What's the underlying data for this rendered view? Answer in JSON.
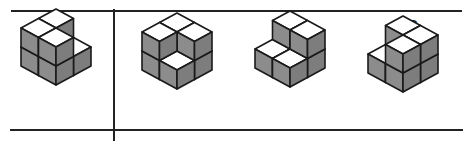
{
  "colors": {
    "top_face": "#ffffff",
    "side_face": "#8c8c8c",
    "side_face_dark": "#7d7d7d",
    "edge": "#1a1a1a",
    "rule": "#222222"
  },
  "reference": {
    "label": "",
    "origin": [
      56,
      47
    ],
    "cubes": [
      [
        0,
        0,
        0
      ],
      [
        1,
        0,
        0
      ],
      [
        0,
        1,
        0
      ],
      [
        1,
        1,
        0
      ],
      [
        0,
        0,
        1
      ],
      [
        0,
        1,
        1
      ],
      [
        1,
        1,
        1
      ]
    ]
  },
  "options": [
    {
      "label": "A",
      "label_x": 181,
      "origin": [
        177,
        51
      ],
      "cubes": [
        [
          0,
          0,
          0
        ],
        [
          1,
          0,
          0
        ],
        [
          0,
          1,
          0
        ],
        [
          1,
          1,
          0
        ],
        [
          0,
          0,
          1
        ],
        [
          1,
          0,
          1
        ],
        [
          0,
          1,
          1
        ]
      ]
    },
    {
      "label": "B",
      "label_x": 293,
      "origin": [
        290,
        49
      ],
      "cubes": [
        [
          0,
          0,
          0
        ],
        [
          1,
          0,
          0
        ],
        [
          0,
          1,
          0
        ],
        [
          1,
          1,
          0
        ],
        [
          0,
          0,
          1
        ],
        [
          1,
          0,
          1
        ]
      ]
    },
    {
      "label": "C",
      "label_x": 413,
      "origin": [
        403,
        54
      ],
      "cubes": [
        [
          0,
          0,
          0
        ],
        [
          1,
          0,
          0
        ],
        [
          0,
          1,
          0
        ],
        [
          1,
          1,
          0
        ],
        [
          0,
          0,
          1
        ],
        [
          1,
          0,
          1
        ],
        [
          1,
          1,
          1
        ]
      ]
    }
  ]
}
